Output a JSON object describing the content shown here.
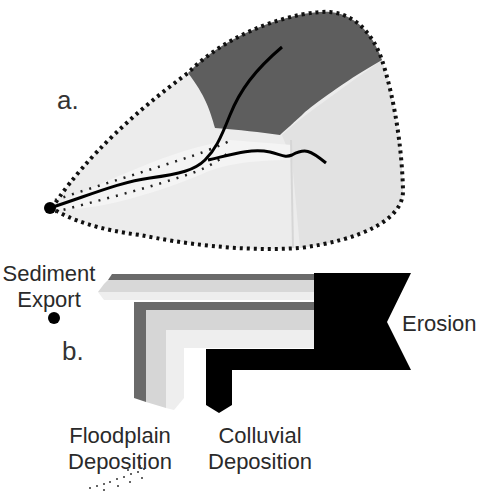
{
  "figure": {
    "panel_a": {
      "label": "a.",
      "regions": [
        {
          "name": "erosion-zone",
          "color": "#5f5f5f"
        },
        {
          "name": "upland-zone-left",
          "color": "#e9e9e9"
        },
        {
          "name": "upland-zone-right",
          "color": "#e1e1e1"
        }
      ],
      "outline_style": "dotted",
      "outlet_marker": "filled-circle"
    },
    "panel_b": {
      "label": "b.",
      "labels": {
        "sediment_export_line1": "Sediment",
        "sediment_export_line2": "Export",
        "erosion": "Erosion",
        "floodplain_line1": "Floodplain",
        "floodplain_line2": "Deposition",
        "colluvial_line1": "Colluvial",
        "colluvial_line2": "Deposition"
      },
      "flows": [
        {
          "name": "erosion",
          "color": "#000000"
        },
        {
          "name": "sediment-export",
          "colors": [
            "#6a6a6a",
            "#d6d6d6",
            "#ececec"
          ]
        },
        {
          "name": "floodplain-deposition",
          "colors": [
            "#6a6a6a",
            "#d6d6d6",
            "#ececec"
          ]
        },
        {
          "name": "colluvial-deposition",
          "color": "#000000"
        }
      ]
    }
  }
}
